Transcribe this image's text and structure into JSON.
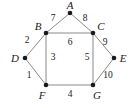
{
  "figure": {
    "background_color": "#ffffff",
    "edge_color": "#8a8a8a",
    "node_color": "#1a1a1a",
    "text_color": "#1a1a1a"
  },
  "chart_data": {
    "type": "diagram",
    "subtype": "node-link-graph",
    "title": "",
    "directed": false,
    "weighted": true,
    "nodes": [
      {
        "id": "A",
        "label": "A",
        "x": 70,
        "y": 13,
        "label_x": 70,
        "label_y": 5
      },
      {
        "id": "B",
        "label": "B",
        "x": 46,
        "y": 33,
        "label_x": 38,
        "label_y": 26
      },
      {
        "id": "C",
        "label": "C",
        "x": 93,
        "y": 33,
        "label_x": 101,
        "label_y": 26
      },
      {
        "id": "D",
        "label": "D",
        "x": 25,
        "y": 58,
        "label_x": 15,
        "label_y": 58
      },
      {
        "id": "E",
        "label": "E",
        "x": 114,
        "y": 58,
        "label_x": 123,
        "label_y": 58
      },
      {
        "id": "F",
        "label": "F",
        "x": 46,
        "y": 85,
        "label_x": 42,
        "label_y": 95
      },
      {
        "id": "G",
        "label": "G",
        "x": 93,
        "y": 85,
        "label_x": 97,
        "label_y": 95
      }
    ],
    "edges": [
      {
        "source": "A",
        "target": "B",
        "weight": 7,
        "label": "7",
        "label_x": 53,
        "label_y": 19
      },
      {
        "source": "A",
        "target": "C",
        "weight": 8,
        "label": "8",
        "label_x": 85,
        "label_y": 19
      },
      {
        "source": "B",
        "target": "C",
        "weight": 6,
        "label": "6",
        "label_x": 70,
        "label_y": 43
      },
      {
        "source": "B",
        "target": "D",
        "weight": 2,
        "label": "2",
        "label_x": 27,
        "label_y": 41
      },
      {
        "source": "B",
        "target": "F",
        "weight": 3,
        "label": "3",
        "label_x": 53,
        "label_y": 58
      },
      {
        "source": "C",
        "target": "E",
        "weight": 9,
        "label": "9",
        "label_x": 105,
        "label_y": 43
      },
      {
        "source": "C",
        "target": "G",
        "weight": 5,
        "label": "5",
        "label_x": 87,
        "label_y": 58
      },
      {
        "source": "D",
        "target": "F",
        "weight": 1,
        "label": "1",
        "label_x": 29,
        "label_y": 76
      },
      {
        "source": "E",
        "target": "G",
        "weight": 10,
        "label": "10",
        "label_x": 108,
        "label_y": 76
      },
      {
        "source": "F",
        "target": "G",
        "weight": 4,
        "label": "4",
        "label_x": 70,
        "label_y": 95
      }
    ],
    "node_radius": 2.3,
    "xlim": [
      0,
      132
    ],
    "ylim": [
      0,
      108
    ],
    "grid": false,
    "legend": null
  }
}
